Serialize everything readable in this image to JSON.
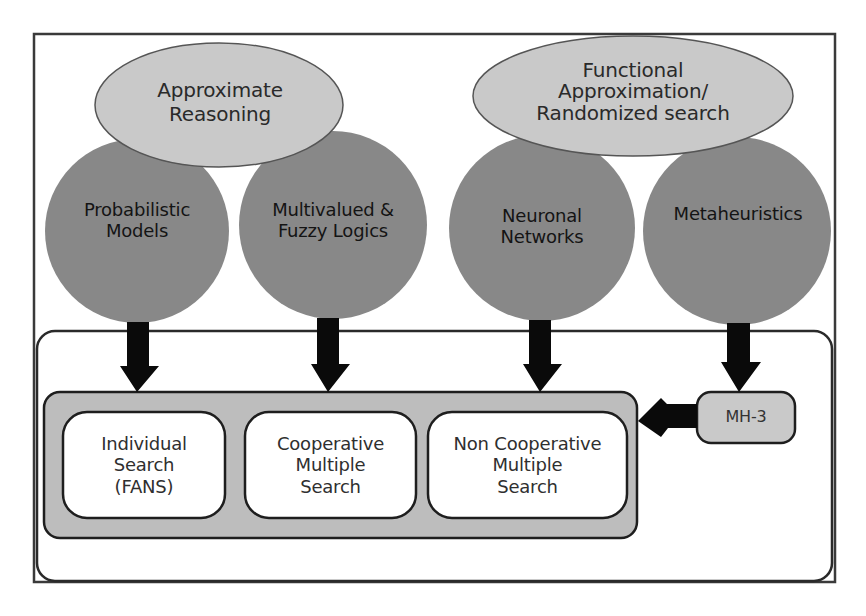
{
  "diagram": {
    "colors": {
      "frame_stroke": "#3a3a3a",
      "ellipse_fill": "#c9c9c9",
      "circle_fill": "#888888",
      "container_fill": "#bdbdbd",
      "box_fill": "#ffffff",
      "arrow_fill": "#0a0a0a"
    },
    "ellipses": [
      {
        "id": "approximate-reasoning",
        "label": "Approximate\nReasoning"
      },
      {
        "id": "functional-approximation",
        "label": "Functional\nApproximation/\nRandomized search"
      }
    ],
    "circles": [
      {
        "id": "probabilistic-models",
        "label": "Probabilistic\nModels"
      },
      {
        "id": "multivalued-fuzzy-logics",
        "label": "Multivalued &\nFuzzy Logics"
      },
      {
        "id": "neuronal-networks",
        "label": "Neuronal\nNetworks"
      },
      {
        "id": "metaheuristics",
        "label": "Metaheuristics"
      }
    ],
    "search_boxes": [
      {
        "id": "individual-search",
        "label": "Individual\nSearch\n(FANS)"
      },
      {
        "id": "cooperative-multiple-search",
        "label": "Cooperative\nMultiple\nSearch"
      },
      {
        "id": "non-cooperative-multiple-search",
        "label": "Non Cooperative\nMultiple\nSearch"
      }
    ],
    "mh_box": {
      "label": "MH-3"
    }
  }
}
